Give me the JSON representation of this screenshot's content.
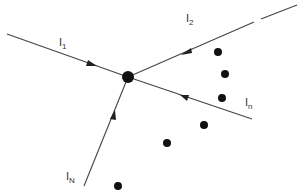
{
  "diagram": {
    "type": "node-with-incoming-edges",
    "colors": {
      "line": "#444444",
      "node": "#111111",
      "text": "#333333",
      "background": "#ffffff"
    },
    "central_node": {
      "x": 128,
      "y": 77,
      "r": 6
    },
    "edges": [
      {
        "id": "I1",
        "label_main": "I",
        "label_sub": "1",
        "from": [
          7,
          34
        ],
        "to": [
          128,
          77
        ],
        "arrow": [
          95,
          65
        ],
        "label_pos": [
          60,
          44
        ]
      },
      {
        "id": "I2",
        "label_main": "I",
        "label_sub": "2",
        "from": [
          297,
          5
        ],
        "to": [
          128,
          77
        ],
        "arrow": [
          183,
          54
        ],
        "label_pos": [
          186,
          22
        ],
        "gap": [
          [
            254,
            22
          ],
          [
            261,
            19
          ]
        ]
      },
      {
        "id": "In",
        "label_main": "I",
        "label_sub": "n",
        "from": [
          252,
          119
        ],
        "to": [
          128,
          77
        ],
        "arrow": [
          182,
          97
        ],
        "label_pos": [
          245,
          108
        ]
      },
      {
        "id": "IN",
        "label_main": "I",
        "label_sub": "N",
        "from": [
          84,
          186
        ],
        "to": [
          128,
          77
        ],
        "arrow": [
          113,
          113
        ],
        "label_pos": [
          66,
          180
        ]
      }
    ],
    "dots": [
      {
        "x": 218,
        "y": 52
      },
      {
        "x": 225,
        "y": 74
      },
      {
        "x": 222,
        "y": 98
      },
      {
        "x": 204,
        "y": 125
      },
      {
        "x": 167,
        "y": 143
      },
      {
        "x": 118,
        "y": 186
      }
    ]
  },
  "labels": {
    "i1": {
      "main": "I",
      "sub": "1"
    },
    "i2": {
      "main": "I",
      "sub": "2"
    },
    "in": {
      "main": "I",
      "sub": "n"
    },
    "iN": {
      "main": "I",
      "sub": "N"
    }
  }
}
